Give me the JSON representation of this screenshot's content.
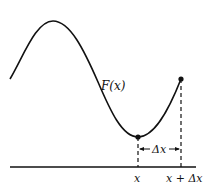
{
  "diagram": {
    "function_label": "F(x)",
    "delta_label": "Δx",
    "x_tick_label": "x",
    "x_plus_delta_label": "x + Δx",
    "colors": {
      "stroke": "#111111",
      "background": "#ffffff"
    }
  }
}
